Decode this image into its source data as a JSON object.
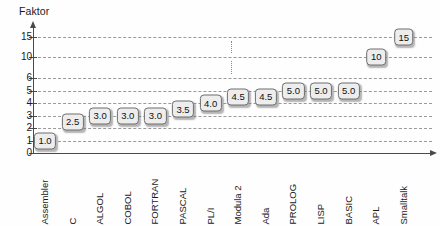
{
  "chart_data": {
    "type": "bar",
    "title": "Faktor",
    "xlabel": "",
    "ylabel": "Faktor",
    "grid": true,
    "legend": false,
    "ylim": [
      0,
      15
    ],
    "ytick_labels": [
      "0",
      "1",
      "2",
      "3",
      "4",
      "5",
      "6",
      "10",
      "15"
    ],
    "ytick_values": [
      0,
      1,
      2,
      3,
      4,
      5,
      6,
      10,
      15
    ],
    "scale_break": true,
    "categories": [
      "Assembler",
      "C",
      "ALGOL",
      "COBOL",
      "FORTRAN",
      "PASCAL",
      "PL/I",
      "Modula 2",
      "Ada",
      "PROLOG",
      "LISP",
      "BASIC",
      "APL",
      "Smalltalk"
    ],
    "values": [
      1.0,
      2.5,
      3.0,
      3.0,
      3.0,
      3.5,
      4.0,
      4.5,
      4.5,
      5.0,
      5.0,
      5.0,
      10,
      15
    ],
    "value_labels": [
      "1.0",
      "2.5",
      "3.0",
      "3.0",
      "3.0",
      "3.5",
      "4.0",
      "4.5",
      "4.5",
      "5.0",
      "5.0",
      "5.0",
      "10",
      "15"
    ]
  },
  "colors": {
    "axis": "#4a4a4a",
    "grid": "#9a9a9a",
    "box_fill": "#ededed",
    "box_border": "#6e6e6e",
    "text": "#1a1a1a",
    "background": "#fefefe"
  }
}
